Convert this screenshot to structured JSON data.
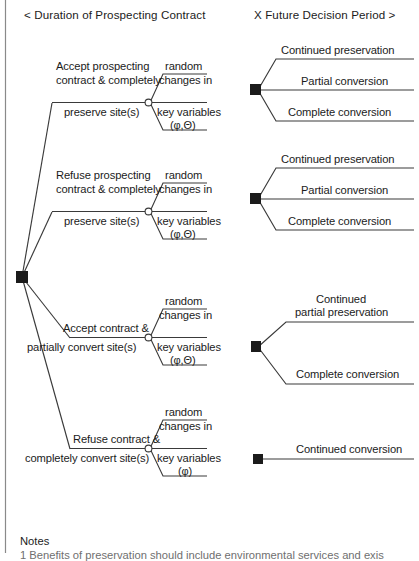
{
  "header": {
    "left": "<  Duration of Prospecting Contract",
    "right": "X  Future Decision Period >"
  },
  "nodes": {
    "root_name": "root-decision-node",
    "chance_name": "chance-node",
    "decision_name": "decision-node"
  },
  "branches": [
    {
      "id": "accept-preserve",
      "action_line1": "Accept prospecting",
      "action_line2": "contract & completely",
      "action_line3": "preserve site(s)",
      "event_line1": "random",
      "event_line2": "changes in",
      "event_line3": "key variables",
      "event_vars": "(φ,Θ)",
      "outcomes": [
        "Continued preservation",
        "Partial conversion",
        "Complete conversion"
      ]
    },
    {
      "id": "refuse-preserve",
      "action_line1": "Refuse prospecting",
      "action_line2": "contract & completely",
      "action_line3": "preserve site(s)",
      "event_line1": "random",
      "event_line2": "changes in",
      "event_line3": "key variables",
      "event_vars": "(φ,Θ)",
      "outcomes": [
        "Continued preservation",
        "Partial conversion",
        "Complete conversion"
      ]
    },
    {
      "id": "accept-partial-convert",
      "action_line1": "Accept contract &",
      "action_line2": "partially convert site(s)",
      "action_line3": "",
      "event_line1": "random",
      "event_line2": "changes in",
      "event_line3": "key variables",
      "event_vars": "(φ,Θ)",
      "outcomes": [
        "Continued\npartial preservation",
        "Complete conversion"
      ]
    },
    {
      "id": "refuse-complete-convert",
      "action_line1": "Refuse contract &",
      "action_line2": "completely convert site(s)",
      "action_line3": "",
      "event_line1": "random",
      "event_line2": "changes in",
      "event_line3": "key variables",
      "event_vars": "(φ)",
      "outcomes": [
        "Continued conversion"
      ]
    }
  ],
  "outcome_text": {
    "b1o1": "Continued preservation",
    "b1o2": "Partial conversion",
    "b1o3": "Complete conversion",
    "b2o1": "Continued preservation",
    "b2o2": "Partial conversion",
    "b2o3": "Complete conversion",
    "b3o1a": "Continued",
    "b3o1b": "partial preservation",
    "b3o2": "Complete conversion",
    "b4o1": "Continued conversion"
  },
  "notes": {
    "title": "Notes",
    "item1": "1  Benefits of preservation should include environmental services and exis"
  },
  "colors": {
    "ink": "#1b1b1b",
    "line": "#3a3a3a",
    "border": "#8a8a8a",
    "faded": "#6f6f6f"
  }
}
